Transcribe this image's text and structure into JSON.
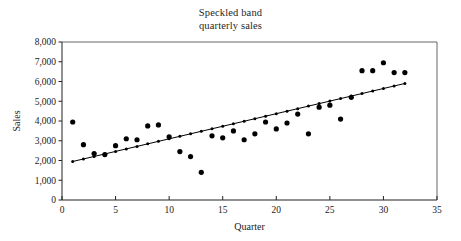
{
  "chart_data": {
    "type": "scatter",
    "title": "Speckled band quarterly sales",
    "title_lines": [
      "Speckled band",
      "quarterly sales"
    ],
    "xlabel": "Quarter",
    "ylabel": "Sales",
    "xlim": [
      0,
      35
    ],
    "ylim": [
      0,
      8000
    ],
    "xticks": [
      0,
      5,
      10,
      15,
      20,
      25,
      30,
      35
    ],
    "xtick_labels": [
      "0",
      "5",
      "10",
      "15",
      "20",
      "25",
      "30",
      "35"
    ],
    "yticks": [
      0,
      1000,
      2000,
      3000,
      4000,
      5000,
      6000,
      7000,
      8000
    ],
    "ytick_labels": [
      "0",
      "1,000",
      "2,000",
      "3,000",
      "4,000",
      "5,000",
      "6,000",
      "7,000",
      "8,000"
    ],
    "grid": false,
    "legend": "none",
    "marker_color": "#000000",
    "marker_size": 2.6,
    "line_color": "#000000",
    "frame_color": "#555555",
    "x": [
      1,
      2,
      3,
      4,
      5,
      6,
      7,
      8,
      9,
      10,
      11,
      12,
      13,
      14,
      15,
      16,
      17,
      18,
      19,
      20,
      21,
      22,
      23,
      24,
      25,
      26,
      27,
      28,
      29,
      30,
      31,
      32
    ],
    "values": [
      3950,
      2800,
      2350,
      2300,
      2750,
      3100,
      3050,
      3750,
      3800,
      3200,
      2450,
      2200,
      1400,
      3250,
      3150,
      3500,
      3050,
      3350,
      3950,
      3600,
      3900,
      4350,
      3350,
      4700,
      4800,
      4100,
      5200,
      6550,
      6550,
      6950,
      6450,
      6450
    ],
    "trend_line": {
      "name": "linear trend",
      "x_start": 1,
      "y_start": 1950,
      "x_end": 32,
      "y_end": 5900,
      "marker_count": 32,
      "has_markers": true
    }
  }
}
